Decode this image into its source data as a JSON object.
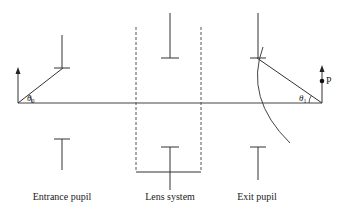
{
  "diagram": {
    "labels": {
      "entrance_pupil": "Entrance pupil",
      "lens_system": "Lens system",
      "exit_pupil": "Exit pupil",
      "point": "P",
      "theta0_symbol": "θ",
      "theta0_sub": "0",
      "theta1_symbol": "θ",
      "theta1_sub": "1"
    },
    "colors": {
      "line": "#333333",
      "dashed": "#555555",
      "text": "#222222"
    }
  }
}
